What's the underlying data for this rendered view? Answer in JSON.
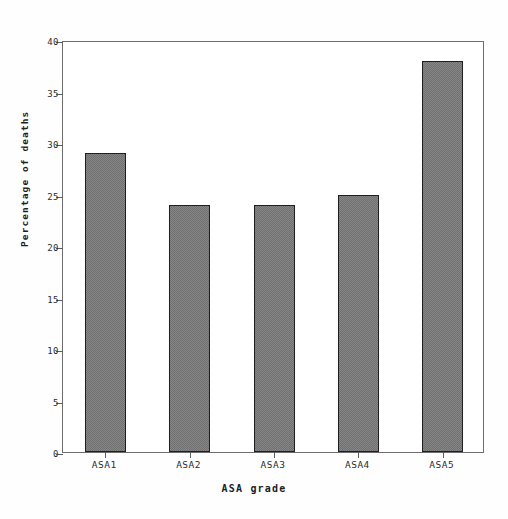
{
  "chart_data": {
    "type": "bar",
    "title": "",
    "subtitle": "",
    "xlabel": "ASA grade",
    "ylabel": "Percentage of deaths",
    "categories": [
      "ASA1",
      "ASA2",
      "ASA3",
      "ASA4",
      "ASA5"
    ],
    "values": [
      29,
      24,
      24,
      25,
      38
    ],
    "ylim": [
      0,
      40
    ],
    "yticks": [
      0,
      5,
      10,
      15,
      20,
      25,
      30,
      35,
      40
    ],
    "ytick_labels": [
      "0",
      "5",
      "10",
      "15",
      "20",
      "25",
      "30",
      "35",
      "40"
    ],
    "grid": false,
    "legend": null,
    "legend_position": "none",
    "bar_color": "#343434",
    "bar_edge_color": "#1f1f1f",
    "axis_color": "#6d6d6d",
    "background_color": "#ffffff",
    "annotations": []
  }
}
